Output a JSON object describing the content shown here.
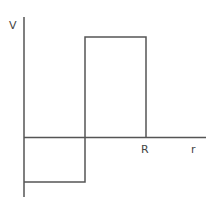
{
  "diagram": {
    "type": "step-potential",
    "axes": {
      "y_label": "V",
      "x_label": "r",
      "x_marker": "R"
    },
    "segments": [
      {
        "from": "0",
        "to": "a",
        "level": "negative"
      },
      {
        "from": "a",
        "to": "R",
        "level": "positive"
      },
      {
        "from": "R",
        "to": "∞",
        "level": "zero"
      }
    ],
    "line_color": "#555555"
  }
}
